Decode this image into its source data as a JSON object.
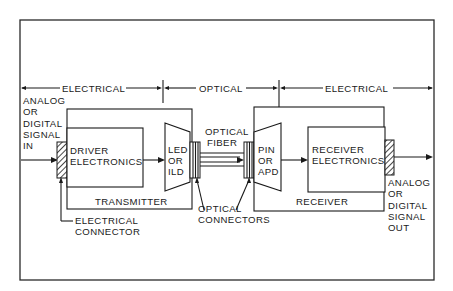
{
  "diagram": {
    "type": "fiber-optic communication link block diagram",
    "colors": {
      "line": "#1a1a1a",
      "background": "#ffffff"
    },
    "regions": {
      "electrical_left": "ELECTRICAL",
      "optical": "OPTICAL",
      "electrical_right": "ELECTRICAL"
    },
    "input_label": [
      "ANALOG",
      "OR",
      "DIGITAL",
      "SIGNAL",
      "IN"
    ],
    "output_label": [
      "ANALOG",
      "OR",
      "DIGITAL",
      "SIGNAL",
      "OUT"
    ],
    "transmitter": {
      "label": "TRANSMITTER",
      "driver": [
        "DRIVER",
        "ELECTRONICS"
      ],
      "source": [
        "LED",
        "OR",
        "ILD"
      ]
    },
    "fiber": [
      "OPTICAL",
      "FIBER"
    ],
    "receiver": {
      "label": "RECEIVER",
      "detector": [
        "PIN",
        "OR",
        "APD"
      ],
      "electronics": [
        "RECEIVER",
        "ELECTRONICS"
      ]
    },
    "electrical_connector_label": [
      "ELECTRICAL",
      "CONNECTOR"
    ],
    "optical_connectors_label": [
      "OPTICAL",
      "CONNECTORS"
    ]
  }
}
